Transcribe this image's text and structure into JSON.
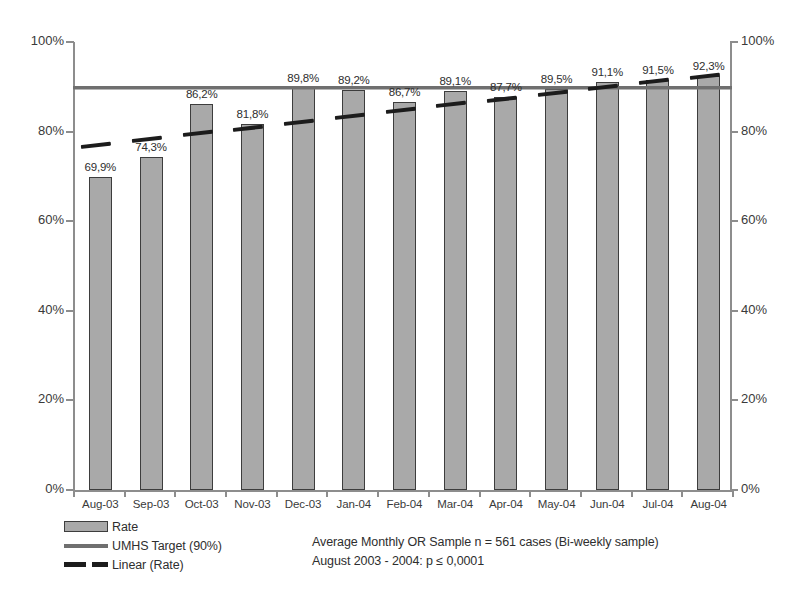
{
  "scan": {
    "top_cut_text": ""
  },
  "chart_data": {
    "type": "bar",
    "title": "",
    "subtitle": "",
    "xlabel": "",
    "ylabel": "",
    "ylim": [
      0,
      100
    ],
    "ytick_labels_left": [
      "100%",
      "80%",
      "60%",
      "40%",
      "20%",
      "0%"
    ],
    "ytick_labels_right": [
      "100%",
      "80%",
      "60%",
      "40%",
      "20%",
      "0%"
    ],
    "ytick_values": [
      100,
      80,
      60,
      40,
      20,
      0
    ],
    "grid": false,
    "legend_position": "bottom-left",
    "categories": [
      "Aug-03",
      "Sep-03",
      "Oct-03",
      "Nov-03",
      "Dec-03",
      "Jan-04",
      "Feb-04",
      "Mar-04",
      "Apr-04",
      "May-04",
      "Jun-04",
      "Jul-04",
      "Aug-04"
    ],
    "series": [
      {
        "name": "Rate",
        "type": "bar",
        "values": [
          69.9,
          74.3,
          86.2,
          81.8,
          89.8,
          89.2,
          86.7,
          89.1,
          87.7,
          89.5,
          91.1,
          91.5,
          92.3
        ],
        "data_labels": [
          "69,9%",
          "74,3%",
          "86,2%",
          "81,8%",
          "89,8%",
          "89,2%",
          "86,7%",
          "89,1%",
          "87,7%",
          "89,5%",
          "91,1%",
          "91,5%",
          "92,3%"
        ],
        "color": "#a9a9a9",
        "border_color": "#3d3d3d"
      },
      {
        "name": "UMHS Target (90%)",
        "type": "line",
        "style": "solid",
        "constant_value": 90,
        "color": "#6f6f6f"
      },
      {
        "name": "Linear (Rate)",
        "type": "trendline",
        "style": "dashed",
        "color": "#1c1c1c",
        "start_value": 77.5,
        "end_value": 93.0
      }
    ],
    "annotations": [
      "Average Monthly OR Sample n = 561 cases (Bi-weekly sample)",
      "August 2003 - 2004: p ≤ 0,0001"
    ]
  },
  "legend": {
    "items": [
      {
        "label": "Rate",
        "swatch": "bar-swatch"
      },
      {
        "label": "UMHS Target (90%)",
        "swatch": "solid-line-swatch"
      },
      {
        "label": "Linear (Rate)",
        "swatch": "dashed-line-swatch"
      }
    ]
  },
  "annotation": {
    "line1": "Average Monthly OR Sample n = 561 cases (Bi-weekly sample)",
    "line2": "August 2003 - 2004: p ≤ 0,0001"
  }
}
